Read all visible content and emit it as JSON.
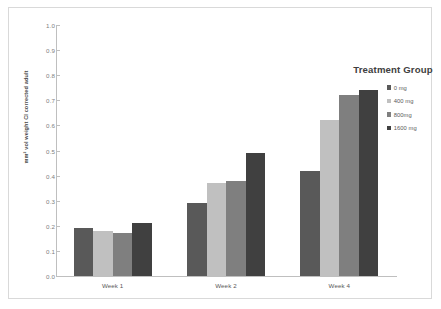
{
  "chart_data": {
    "type": "bar",
    "title": "",
    "xlabel": "",
    "ylabel": "mm² vol weight CI corrected adult",
    "ylim": [
      0.0,
      1.0
    ],
    "ytick_step": 0.1,
    "ytick_labels": [
      "1.0",
      "0.9",
      "0.8",
      "0.7",
      "0.6",
      "0.5",
      "0.4",
      "0.3",
      "0.2",
      "0.1",
      "0.0"
    ],
    "grid": false,
    "legend_position": "top-right",
    "legend_title": "Treatment Group",
    "categories": [
      "Week 1",
      "Week 2",
      "Week 4"
    ],
    "series": [
      {
        "name": "0 mg",
        "color": "#595959",
        "values": [
          0.19,
          0.29,
          0.42
        ]
      },
      {
        "name": "400 mg",
        "color": "#c0c0c0",
        "values": [
          0.18,
          0.37,
          0.62
        ]
      },
      {
        "name": "800mg",
        "color": "#7f7f7f",
        "values": [
          0.17,
          0.38,
          0.72
        ]
      },
      {
        "name": "1600 mg",
        "color": "#404040",
        "values": [
          0.21,
          0.49,
          0.74
        ]
      }
    ]
  }
}
